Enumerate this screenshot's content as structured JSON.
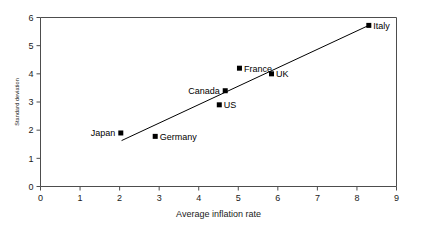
{
  "chart_data": {
    "type": "scatter",
    "title": "",
    "xlabel": "Average inflation rate",
    "ylabel": "Standard deviation",
    "xlim": [
      0,
      9
    ],
    "ylim": [
      0,
      6
    ],
    "xticks": [
      "0",
      "1",
      "2",
      "3",
      "4",
      "5",
      "6",
      "7",
      "8",
      "9"
    ],
    "yticks": [
      "0",
      "1",
      "2",
      "3",
      "4",
      "5",
      "6"
    ],
    "grid": false,
    "legend": "none",
    "points": [
      {
        "label": "Japan",
        "x": 2.03,
        "y": 1.9,
        "label_side": "left"
      },
      {
        "label": "Germany",
        "x": 2.9,
        "y": 1.78,
        "label_side": "right"
      },
      {
        "label": "US",
        "x": 4.52,
        "y": 2.9,
        "label_side": "right"
      },
      {
        "label": "Canada",
        "x": 4.67,
        "y": 3.4,
        "label_side": "left"
      },
      {
        "label": "France",
        "x": 5.03,
        "y": 4.2,
        "label_side": "right"
      },
      {
        "label": "UK",
        "x": 5.84,
        "y": 4.0,
        "label_side": "right"
      },
      {
        "label": "Italy",
        "x": 8.3,
        "y": 5.72,
        "label_side": "right"
      }
    ],
    "trend_line": {
      "x_start": 2.05,
      "y_start": 1.63,
      "x_end": 8.3,
      "y_end": 5.72
    },
    "colors": {
      "marker": "#000000",
      "line": "#000000",
      "frame": "#4d4d4d",
      "text": "#1a1a1a",
      "background": "#ffffff"
    }
  }
}
